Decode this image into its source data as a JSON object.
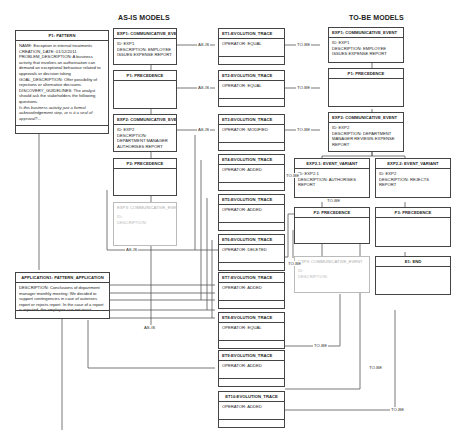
{
  "headings": {
    "as_is": "AS-IS MODELS",
    "to_be": "TO-BE MODELS"
  },
  "pattern": {
    "title": "P1: PATTERN",
    "lines": [
      "NAME: Exception in internal treatments",
      "CREATION_DATE: 01/12/2011",
      "PROBLEM_DESCRIPTION: A business activity that involves an authorisation can demand an exceptional behaviour related to approvals or decision taking",
      "GOAL_DESCRIPTION: Offer possibility of rejections or alternative decisions.",
      "DISCOVERY_GUIDELINES: The analyst should ask the stakeholders the following questions."
    ],
    "italic_question": "Is this business activity just a formal acknowledgement step, or is it a seal of approval?..."
  },
  "application": {
    "title": "APPLICATION1: PATTERN_APPLICATION",
    "description": "DESCRIPTION: Conclusions of department manager monthly meeting: We decided to support contingencies in case of autorises report or rejects report. In the case of a report is rejected, the employee can not insist."
  },
  "as_is": {
    "exp1": {
      "title": "EXP1: COMMUNICATIVE_EVENT",
      "id": "ID: EXP1",
      "description": "DESCRIPTION: EMPLOYEE ISSUES EXPENSE REPORT"
    },
    "p1": {
      "title": "P1: PRECEDENCE"
    },
    "exp2": {
      "title": "EXP2: COMMUNICATIVE_EVENT",
      "id": "ID: EXP2",
      "description": "DESCRIPTION: DEPARTMENT MANAGER AUTHORISES REPORT"
    },
    "p2": {
      "title": "P2: PRECEDENCE"
    },
    "exp3": {
      "title": "EXP3: COMMUNICATIVE_EVENT",
      "id": "ID:",
      "description": "DESCRIPTION:"
    }
  },
  "traces": [
    {
      "title": "ET1:EVOLUTION_TRACE",
      "operator": "OPERATOR: EQUAL"
    },
    {
      "title": "ET2:EVOLUTION_TRACE",
      "operator": "OPERATOR: EQUAL"
    },
    {
      "title": "ET3:EVOLUTION_TRACE",
      "operator": "OPERATOR: MODIFIED"
    },
    {
      "title": "ET4:EVOLUTION_TRACE",
      "operator": "OPERATOR: ADDED"
    },
    {
      "title": "ET5:EVOLUTION_TRACE",
      "operator": "OPERATOR: ADDED"
    },
    {
      "title": "ET6:EVOLUTION_TRACE",
      "operator": "OPERATOR: DELETED"
    },
    {
      "title": "ET7:EVOLUTION_TRACE",
      "operator": "OPERATOR: ADDED"
    },
    {
      "title": "ET8:EVOLUTION_TRACE",
      "operator": "OPERATOR: EQUAL"
    },
    {
      "title": "ET9:EVOLUTION_TRACE",
      "operator": "OPERATOR: ADDED"
    },
    {
      "title": "ET10:EVOLUTION_TRACE",
      "operator": "OPERATOR: ADDED"
    }
  ],
  "to_be": {
    "exp1": {
      "title": "EXP1: COMMUNICATIVE_EVENT",
      "id": "ID: EXP1",
      "description": "DESCRIPTION: EMPLOYEE ISSUES EXPENSE REPORT"
    },
    "p1": {
      "title": "P1: PRECEDENCE"
    },
    "exp2": {
      "title": "EXP2: COMMUNICATIVE_EVENT",
      "id": "ID: EXP2",
      "description": "DESCRIPTION: DEPARTMENT MANAGER REVIEWS EXPENSE REPORT"
    },
    "exp21": {
      "title": "EXP2.1: EVENT_VARIANT",
      "id": "ID: EXP2.1",
      "description": "DESCRIPTION: AUTHORISES REPORT"
    },
    "exp22": {
      "title": "EXP2.2: EVENT_VARIANT",
      "id": "ID: EXP2",
      "description": "DESCRIPTION: REJECTS REPORT"
    },
    "p2": {
      "title": "P2: PRECEDENCE"
    },
    "p3": {
      "title": "P3: PRECEDENCE"
    },
    "exp3": {
      "title": "EXP3: COMMUNICATIVE_EVENT",
      "id": "ID:",
      "description": "DESCRIPTION:"
    },
    "e1": {
      "title": "E1: END"
    }
  },
  "connector_labels": {
    "as_is": "AS-IS",
    "to_be": "TO-BE"
  }
}
